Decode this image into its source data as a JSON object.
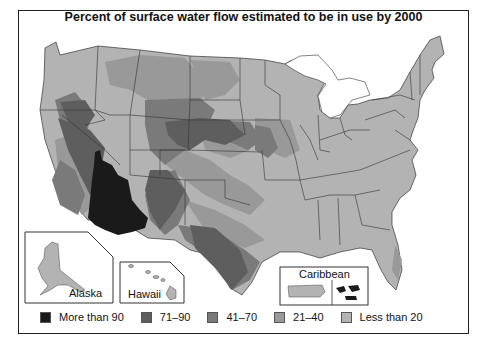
{
  "title": "Percent of surface water flow estimated to be in use by 2000",
  "insets": {
    "alaska": "Alaska",
    "hawaii": "Hawaii",
    "caribbean": "Caribbean"
  },
  "legend": [
    {
      "label": "More than 90",
      "color": "#1a1a1a"
    },
    {
      "label": "71–90",
      "color": "#5e5e5e"
    },
    {
      "label": "41–70",
      "color": "#7a7a7a"
    },
    {
      "label": "21–40",
      "color": "#999999"
    },
    {
      "label": "Less than 20",
      "color": "#b3b3b3"
    }
  ],
  "colors": {
    "more_than_90": "#1a1a1a",
    "c71_90": "#5e5e5e",
    "c41_70": "#7a7a7a",
    "c21_40": "#999999",
    "less_than_20": "#b3b3b3",
    "border": "#333333"
  }
}
